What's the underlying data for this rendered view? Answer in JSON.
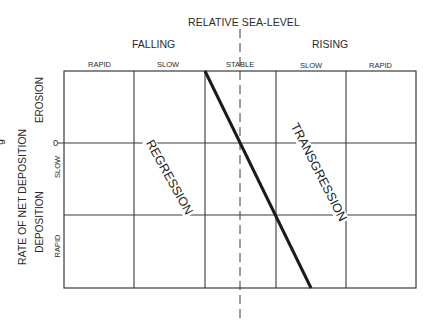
{
  "diagram": {
    "title": "RELATIVE SEA-LEVEL",
    "x_groups": {
      "left": "FALLING",
      "right": "RISING"
    },
    "columns": [
      "RAPID",
      "SLOW",
      "STABLE",
      "SLOW",
      "RAPID"
    ],
    "y_axis": {
      "title": "RATE OF NET DEPOSITION",
      "upper_group": "EROSION",
      "lower_group": "DEPOSITION",
      "zero_label": "0",
      "rows": [
        "SLOW",
        "RAPID"
      ]
    },
    "regions": {
      "left": "REGRESSION",
      "right": "TRANSGRESSION"
    },
    "edge_fragment": "g",
    "colors": {
      "line": "#1a1a1a",
      "grid": "#3a3a3a",
      "text": "#2a2a2a",
      "background": "#ffffff"
    }
  }
}
